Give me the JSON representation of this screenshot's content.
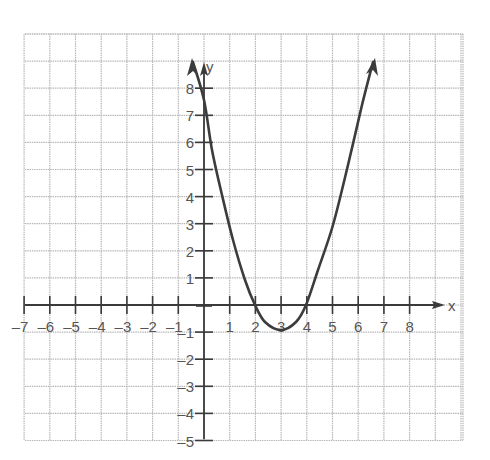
{
  "chart_data": {
    "type": "line",
    "title": "",
    "function": "y = x^2 - 6x + 8",
    "xlabel": "x",
    "ylabel": "y",
    "xlim": [
      -7,
      9
    ],
    "ylim": [
      -5,
      9
    ],
    "grid": true,
    "legend": null,
    "x_tick_labels": [
      "-7",
      "-6",
      "-5",
      "-4",
      "-3",
      "-2",
      "-1",
      "1",
      "2",
      "3",
      "4",
      "5",
      "6",
      "7",
      "8"
    ],
    "y_tick_labels": [
      "8",
      "7",
      "6",
      "5",
      "4",
      "3",
      "2",
      "1",
      "-1",
      "-2",
      "-3",
      "-4",
      "-5"
    ],
    "series": [
      {
        "name": "parabola",
        "x": [
          -0.4,
          0,
          1,
          2,
          2.5,
          3,
          3.5,
          4,
          5,
          6,
          6.6
        ],
        "y": [
          9,
          8,
          3,
          0,
          -0.75,
          -1,
          -0.75,
          0,
          3,
          8,
          9
        ],
        "arrows_at_ends": true
      }
    ],
    "key_points": {
      "y_intercept": [
        0,
        8
      ],
      "x_intercepts": [
        [
          2,
          0
        ],
        [
          4,
          0
        ]
      ],
      "vertex": [
        3,
        -1
      ]
    }
  },
  "axes": {
    "x_label": "x",
    "y_label": "y"
  },
  "colors": {
    "grid": "#b8b8b8",
    "axis": "#3a3a3a",
    "curve": "#3c3c3c",
    "label": "#555555"
  }
}
